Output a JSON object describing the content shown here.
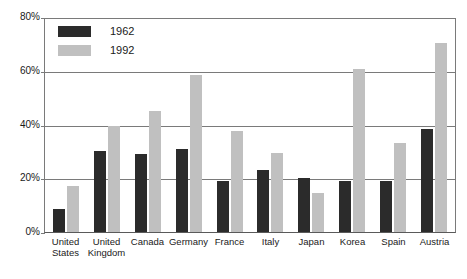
{
  "chart_data": {
    "type": "bar",
    "title": "",
    "xlabel": "",
    "ylabel": "",
    "ylim": [
      0,
      80
    ],
    "yticks": [
      0,
      20,
      40,
      60,
      80
    ],
    "ytick_labels": [
      "0%",
      "20%",
      "40%",
      "60%",
      "80%"
    ],
    "grid": true,
    "legend_position": "upper-left-inside",
    "categories": [
      "United States",
      "United Kingdom",
      "Canada",
      "Germany",
      "France",
      "Italy",
      "Japan",
      "Korea",
      "Spain",
      "Austria"
    ],
    "category_lines": [
      [
        "United",
        "States"
      ],
      [
        "United",
        "Kingdom"
      ],
      [
        "Canada"
      ],
      [
        "Germany"
      ],
      [
        "France"
      ],
      [
        "Italy"
      ],
      [
        "Japan"
      ],
      [
        "Korea"
      ],
      [
        "Spain"
      ],
      [
        "Austria"
      ]
    ],
    "series": [
      {
        "name": "1962",
        "color": "#2b2b2b",
        "values": [
          8.5,
          30,
          29,
          31,
          19,
          23,
          20,
          19,
          19,
          38.5
        ]
      },
      {
        "name": "1992",
        "color": "#c0c0c0",
        "values": [
          17,
          39.5,
          45,
          58.5,
          37.5,
          29.5,
          14.5,
          60.5,
          33,
          70.5
        ]
      }
    ]
  },
  "axis": {
    "y_labels": [
      "80%",
      "60%",
      "40%",
      "20%",
      "0%"
    ]
  },
  "legend": {
    "entries": [
      {
        "label": "1962",
        "color": "#2b2b2b"
      },
      {
        "label": "1992",
        "color": "#c0c0c0"
      }
    ]
  },
  "title_strip": {
    "text": ""
  }
}
